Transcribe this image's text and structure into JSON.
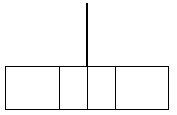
{
  "diagram": {
    "type": "segmented-bar-with-vertical-line",
    "colors": {
      "stroke": "#000000",
      "background": "#ffffff"
    },
    "vertical_line": {
      "x": 87,
      "y1": 3,
      "y2": 66
    },
    "box": {
      "x": 5,
      "y": 66,
      "width": 163,
      "height": 43
    },
    "cells": [
      {
        "x": 5,
        "width": 54
      },
      {
        "x": 58,
        "width": 30
      },
      {
        "x": 86,
        "width": 30
      },
      {
        "x": 114,
        "width": 54
      }
    ]
  }
}
